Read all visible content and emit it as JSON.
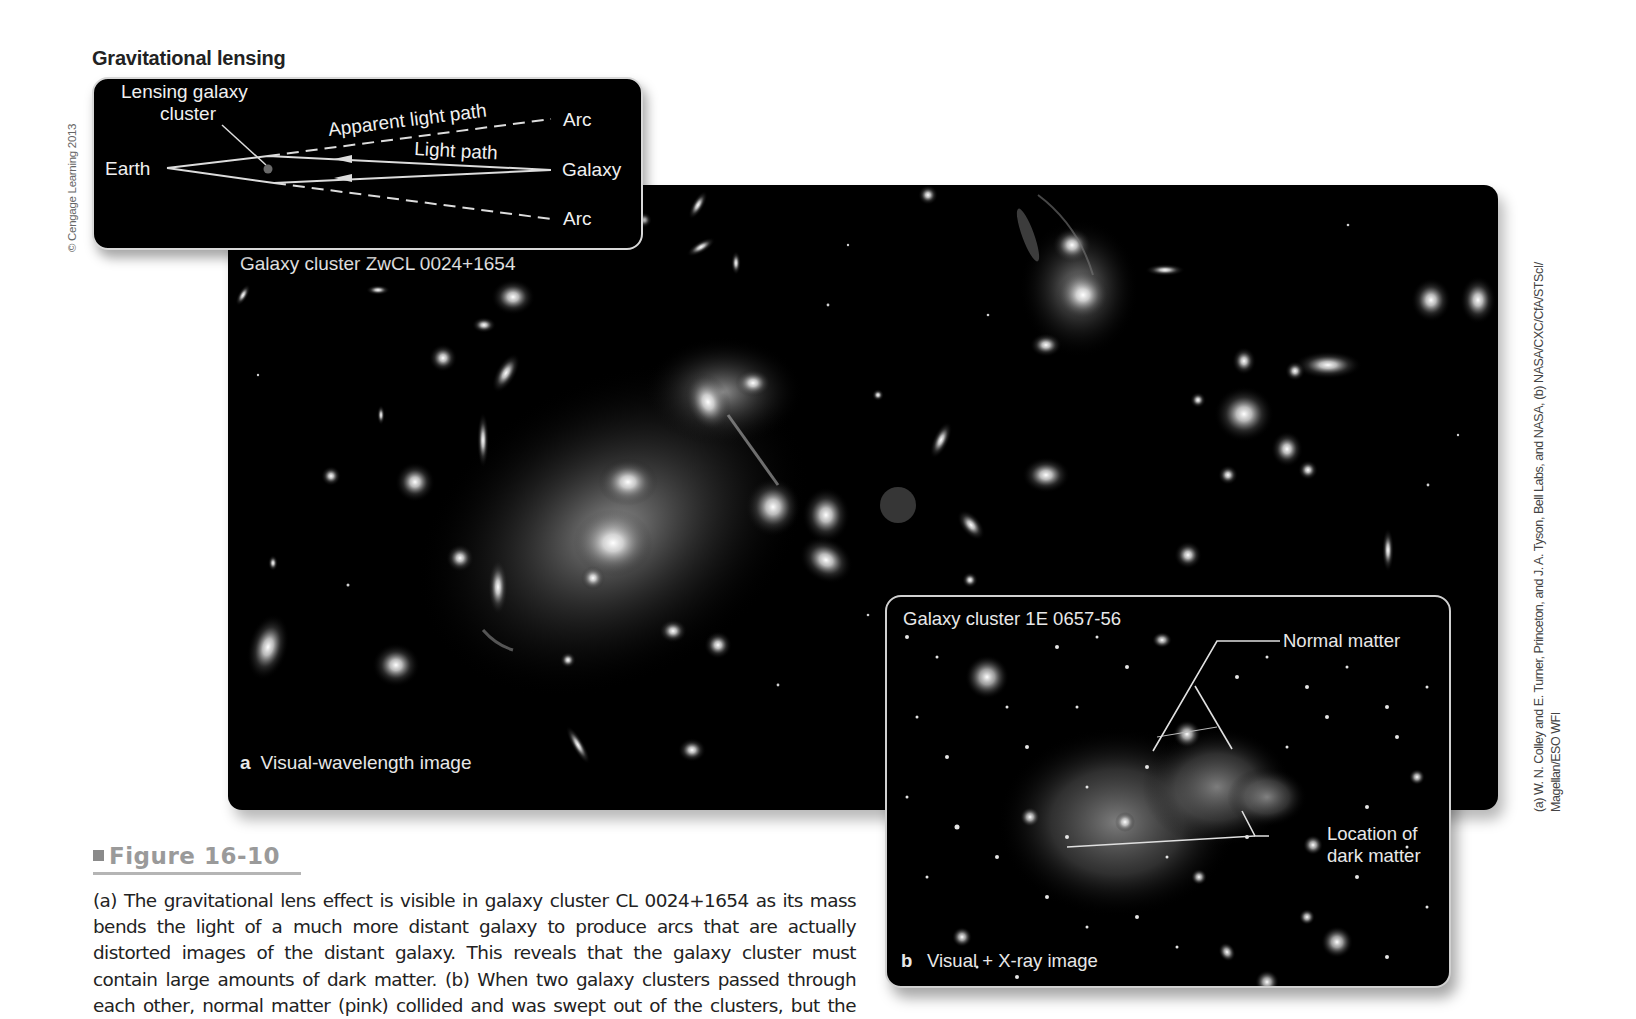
{
  "diagram": {
    "title": "Gravitational lensing",
    "copyright": "© Cengage Learning 2013",
    "labels": {
      "lensing_cluster_line1": "Lensing galaxy",
      "lensing_cluster_line2": "cluster",
      "earth": "Earth",
      "apparent_light_path": "Apparent light path",
      "light_path": "Light path",
      "arc_top": "Arc",
      "galaxy": "Galaxy",
      "arc_bottom": "Arc"
    }
  },
  "panel_a": {
    "title": "Galaxy cluster ZwCL 0024+1654",
    "letter": "a",
    "caption": "Visual-wavelength image"
  },
  "panel_b": {
    "title": "Galaxy cluster 1E 0657-56",
    "letter": "b",
    "caption": "Visual + X-ray image",
    "annotations": {
      "normal_matter": "Normal matter",
      "dark_matter_line1": "Location of",
      "dark_matter_line2": "dark matter"
    }
  },
  "figure": {
    "label": "Figure 16-10",
    "caption_lines": [
      "(a) The gravitational lens effect is visible in galaxy cluster CL 0024+1654 as its mass",
      "bends the light of a much more distant galaxy to produce arcs that are actually",
      "distorted images of the distant galaxy. This reveals that the galaxy cluster must",
      "contain large amounts of dark matter. (b) When two galaxy clusters passed through",
      "each other, normal matter (pink) collided and was swept out of the clusters, but the"
    ]
  },
  "credit": {
    "line1": "(a) W. N. Colley and E. Turner, Princeton, and J. A. Tyson, Bell Labs, and NASA, (b) NASA/CXC/CfA/STScI/",
    "line2": "Magellan/ESO WFI"
  }
}
